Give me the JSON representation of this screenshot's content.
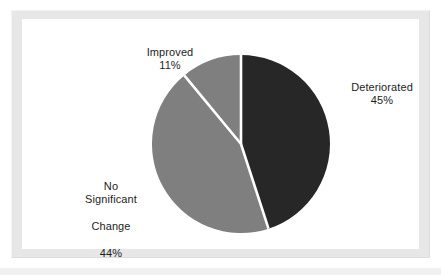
{
  "figure": {
    "background_color": "#ffffff",
    "panel_color": "#ffffff",
    "frame_color": "#e7e7e7",
    "text_color": "#1d1d1d",
    "divider_color": "#ffffff"
  },
  "chart_data": {
    "type": "pie",
    "title": "",
    "subtitle": "",
    "xlabel": "",
    "ylabel": "",
    "legend_position": "none",
    "grid": false,
    "start_angle_deg": 0,
    "direction": "clockwise",
    "categories": [
      "Deteriorated",
      "No Significant Change",
      "Improved"
    ],
    "values": [
      45,
      44,
      11
    ],
    "value_unit": "%",
    "colors": [
      "#272727",
      "#7f7f7f",
      "#7f7f7f"
    ],
    "slices": [
      {
        "label": "Deteriorated",
        "label_lines": [
          "Deteriorated"
        ],
        "value": 45,
        "value_text": "45%",
        "color": "#272727",
        "start_angle_deg": 0,
        "end_angle_deg": 162,
        "label_position": "right"
      },
      {
        "label": "No Significant Change",
        "label_lines": [
          "No",
          "Significant",
          "Change"
        ],
        "value": 44,
        "value_text": "44%",
        "color": "#7f7f7f",
        "start_angle_deg": 162,
        "end_angle_deg": 320.4,
        "label_position": "left"
      },
      {
        "label": "Improved",
        "label_lines": [
          "Improved"
        ],
        "value": 11,
        "value_text": "11%",
        "color": "#7f7f7f",
        "start_angle_deg": 320.4,
        "end_angle_deg": 360,
        "label_position": "top-left"
      }
    ],
    "annotations": []
  },
  "labels": {
    "improved": {
      "name": "Improved",
      "percent": "11%"
    },
    "deteriorated": {
      "name": "Deteriorated",
      "percent": "45%"
    },
    "no_significant_change": {
      "line1": "No",
      "line2": "Significant",
      "line3": "Change",
      "percent": "44%"
    }
  }
}
